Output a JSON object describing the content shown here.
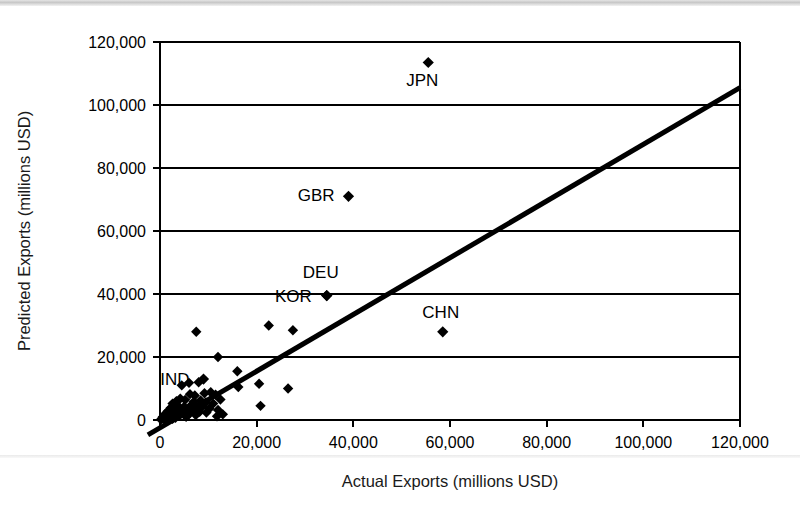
{
  "figure": {
    "background": "#ffffff",
    "ink_color": "#000000"
  },
  "chart_data": {
    "type": "scatter",
    "title": "",
    "subtitle": "",
    "xlabel": "Actual Exports (millions USD)",
    "ylabel": "Predicted Exports (millions USD)",
    "xlim": [
      0,
      120000
    ],
    "ylim": [
      0,
      120000
    ],
    "xticks": [
      0,
      20000,
      40000,
      60000,
      80000,
      100000,
      120000
    ],
    "yticks": [
      0,
      20000,
      40000,
      60000,
      80000,
      100000,
      120000
    ],
    "xtick_labels": [
      "0",
      "20,000",
      "40,000",
      "60,000",
      "80,000",
      "100,000",
      "120,000"
    ],
    "ytick_labels": [
      "0",
      "20,000",
      "40,000",
      "60,000",
      "80,000",
      "100,000",
      "120,000"
    ],
    "grid": "horizontal",
    "legend": "none",
    "marker": "filled-diamond",
    "marker_color": "#000000",
    "series": [
      {
        "name": "Countries",
        "points": [
          {
            "label": "JPN",
            "x": 55500,
            "y": 113500,
            "label_pos": "below"
          },
          {
            "label": "GBR",
            "x": 39000,
            "y": 71000,
            "label_pos": "left"
          },
          {
            "label": "DEU",
            "x": 34500,
            "y": 39500,
            "label_pos": "above"
          },
          {
            "label": "KOR",
            "x": 34500,
            "y": 39500,
            "label_pos": "left"
          },
          {
            "label": "CHN",
            "x": 58500,
            "y": 28000,
            "label_pos": "above"
          },
          {
            "label": "IND",
            "x": 9000,
            "y": 13000,
            "label_pos": "left"
          },
          {
            "label": "",
            "x": 7500,
            "y": 28000
          },
          {
            "label": "",
            "x": 22500,
            "y": 30000
          },
          {
            "label": "",
            "x": 27500,
            "y": 28500
          },
          {
            "label": "",
            "x": 12000,
            "y": 20000
          },
          {
            "label": "",
            "x": 16000,
            "y": 15500
          },
          {
            "label": "",
            "x": 16200,
            "y": 10500
          },
          {
            "label": "",
            "x": 20500,
            "y": 11500
          },
          {
            "label": "",
            "x": 26500,
            "y": 10000
          },
          {
            "label": "",
            "x": 20800,
            "y": 4500
          },
          {
            "label": "",
            "x": 6000,
            "y": 11800
          },
          {
            "label": "",
            "x": 8000,
            "y": 12000
          },
          {
            "label": "",
            "x": 4500,
            "y": 11000
          },
          {
            "label": "",
            "x": 10500,
            "y": 8800
          },
          {
            "label": "",
            "x": 11500,
            "y": 8000
          },
          {
            "label": "",
            "x": 9200,
            "y": 8500
          },
          {
            "label": "",
            "x": 7200,
            "y": 7800
          },
          {
            "label": "",
            "x": 6200,
            "y": 8200
          },
          {
            "label": "",
            "x": 12500,
            "y": 6500
          },
          {
            "label": "",
            "x": 11000,
            "y": 5200
          },
          {
            "label": "",
            "x": 9500,
            "y": 5600
          },
          {
            "label": "",
            "x": 5200,
            "y": 6400
          },
          {
            "label": "",
            "x": 4200,
            "y": 6800
          },
          {
            "label": "",
            "x": 3400,
            "y": 6000
          },
          {
            "label": "",
            "x": 2600,
            "y": 5200
          },
          {
            "label": "",
            "x": 3800,
            "y": 4400
          },
          {
            "label": "",
            "x": 5000,
            "y": 4200
          },
          {
            "label": "",
            "x": 6400,
            "y": 4600
          },
          {
            "label": "",
            "x": 7600,
            "y": 4000
          },
          {
            "label": "",
            "x": 8800,
            "y": 4400
          },
          {
            "label": "",
            "x": 10200,
            "y": 3600
          },
          {
            "label": "",
            "x": 12000,
            "y": 3200
          },
          {
            "label": "",
            "x": 2200,
            "y": 3800
          },
          {
            "label": "",
            "x": 3000,
            "y": 3000
          },
          {
            "label": "",
            "x": 4400,
            "y": 3200
          },
          {
            "label": "",
            "x": 5600,
            "y": 2800
          },
          {
            "label": "",
            "x": 6800,
            "y": 3000
          },
          {
            "label": "",
            "x": 8200,
            "y": 2600
          },
          {
            "label": "",
            "x": 9600,
            "y": 2400
          },
          {
            "label": "",
            "x": 1600,
            "y": 2800
          },
          {
            "label": "",
            "x": 2400,
            "y": 2200
          },
          {
            "label": "",
            "x": 3600,
            "y": 2000
          },
          {
            "label": "",
            "x": 4800,
            "y": 2200
          },
          {
            "label": "",
            "x": 6000,
            "y": 1800
          },
          {
            "label": "",
            "x": 7400,
            "y": 1600
          },
          {
            "label": "",
            "x": 1000,
            "y": 1800
          },
          {
            "label": "",
            "x": 1800,
            "y": 1400
          },
          {
            "label": "",
            "x": 2800,
            "y": 1200
          },
          {
            "label": "",
            "x": 4000,
            "y": 1400
          },
          {
            "label": "",
            "x": 5400,
            "y": 1000
          },
          {
            "label": "",
            "x": 600,
            "y": 1000
          },
          {
            "label": "",
            "x": 1200,
            "y": 800
          },
          {
            "label": "",
            "x": 2000,
            "y": 600
          },
          {
            "label": "",
            "x": 3200,
            "y": 700
          },
          {
            "label": "",
            "x": 400,
            "y": 500
          },
          {
            "label": "",
            "x": 900,
            "y": 300
          },
          {
            "label": "",
            "x": 1500,
            "y": 200
          },
          {
            "label": "",
            "x": 200,
            "y": 150
          },
          {
            "label": "",
            "x": 2600,
            "y": 400
          },
          {
            "label": "",
            "x": 7000,
            "y": 5800
          },
          {
            "label": "",
            "x": 8400,
            "y": 6200
          },
          {
            "label": "",
            "x": 13000,
            "y": 1800
          },
          {
            "label": "",
            "x": 11800,
            "y": 1200
          }
        ]
      }
    ],
    "trendline": {
      "type": "linear",
      "slope": 0.9,
      "intercept": -2500,
      "color": "#000000",
      "width": 5,
      "extends_beyond_axes": true
    },
    "annotations": [
      "JPN",
      "GBR",
      "DEU",
      "KOR",
      "CHN",
      "IND"
    ]
  }
}
